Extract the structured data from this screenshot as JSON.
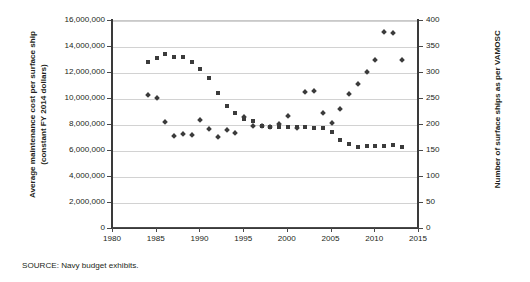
{
  "chart_data": {
    "type": "scatter",
    "title": "",
    "xlabel": "",
    "ylabel": "Average maintenance cost per surface ship\n(constant FY 2014 dollars)",
    "y2label": "Number of surface ships as per VAMOSC",
    "xlim": [
      1980,
      2015
    ],
    "ylim": [
      0,
      16000000
    ],
    "y2lim": [
      0,
      400
    ],
    "grid": true,
    "legend": "none",
    "x_ticks": [
      "1980",
      "1985",
      "1990",
      "1995",
      "2000",
      "2005",
      "2010",
      "2015"
    ],
    "x_tick_values": [
      1980,
      1985,
      1990,
      1995,
      2000,
      2005,
      2010,
      2015
    ],
    "y_ticks": [
      "0",
      "2,000,000",
      "4,000,000",
      "6,000,000",
      "8,000,000",
      "10,000,000",
      "12,000,000",
      "14,000,000",
      "16,000,000"
    ],
    "y_tick_values": [
      0,
      2000000,
      4000000,
      6000000,
      8000000,
      10000000,
      12000000,
      14000000,
      16000000
    ],
    "y2_ticks": [
      "0",
      "50",
      "100",
      "150",
      "200",
      "250",
      "300",
      "350",
      "400"
    ],
    "y2_tick_values": [
      0,
      50,
      100,
      150,
      200,
      250,
      300,
      350,
      400
    ],
    "series": [
      {
        "name": "Average maintenance cost per surface ship (constant FY 2014 dollars)",
        "marker": "diamond",
        "color": "#3b3b3b",
        "axis": "left",
        "x": [
          1984,
          1985,
          1986,
          1987,
          1988,
          1989,
          1990,
          1991,
          1992,
          1993,
          1994,
          1995,
          1996,
          1997,
          1998,
          1999,
          2000,
          2001,
          2002,
          2003,
          2004,
          2005,
          2006,
          2007,
          2008,
          2009,
          2010,
          2011,
          2012,
          2013
        ],
        "y": [
          10300000,
          10100000,
          8200000,
          7150000,
          7300000,
          7250000,
          8350000,
          7700000,
          7050000,
          7600000,
          7350000,
          8600000,
          7950000,
          7900000,
          7850000,
          8050000,
          8700000,
          7800000,
          10550000,
          10600000,
          8950000,
          8150000,
          9250000,
          10400000,
          11150000,
          12100000,
          13000000,
          15150000,
          15100000,
          13000000
        ]
      },
      {
        "name": "Number of surface ships as per VAMOSC",
        "marker": "square",
        "color": "#3b3b3b",
        "axis": "right",
        "x": [
          1984,
          1985,
          1986,
          1987,
          1988,
          1989,
          1990,
          1991,
          1992,
          1993,
          1994,
          1995,
          1996,
          1997,
          1998,
          1999,
          2000,
          2001,
          2002,
          2003,
          2004,
          2005,
          2006,
          2007,
          2008,
          2009,
          2010,
          2011,
          2012,
          2013
        ],
        "y": [
          321,
          328,
          337,
          331,
          331,
          321,
          307,
          290,
          262,
          236,
          224,
          212,
          208,
          198,
          196,
          196,
          197,
          196,
          196,
          194,
          194,
          187,
          172,
          164,
          158,
          160,
          160,
          160,
          162,
          157
        ]
      }
    ]
  },
  "source": {
    "note": "SOURCE: Navy budget exhibits."
  }
}
